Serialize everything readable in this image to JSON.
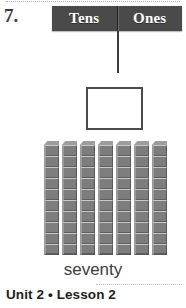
{
  "problem": {
    "number_label": "7.",
    "number_word": "seventy",
    "answer_box_value": ""
  },
  "place_value_chart": {
    "columns": [
      {
        "label": "Tens"
      },
      {
        "label": "Ones"
      }
    ]
  },
  "base_ten_blocks": {
    "rod_count": 7,
    "cubes_per_rod": 10,
    "total_cubes": 70,
    "block_face_color": "#7d7d7d",
    "block_top_color": "#9d9d9d"
  },
  "footer": {
    "text": "Unit 2 • Lesson 2"
  },
  "colors": {
    "header_bar": "#4a4a4a",
    "header_text": "#ffffff",
    "ink": "#3a3a3a",
    "page_background": "#ffffff"
  }
}
